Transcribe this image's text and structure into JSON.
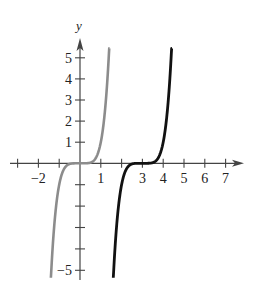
{
  "chart_data": {
    "type": "line",
    "title": "",
    "xlabel": "x",
    "ylabel": "y",
    "xlim": [
      -3,
      7.8
    ],
    "ylim": [
      -5.2,
      5.8
    ],
    "grid": false,
    "legend": null,
    "x_ticks": [
      -3,
      -2,
      -1,
      0,
      1,
      2,
      3,
      4,
      5,
      6,
      7
    ],
    "x_tick_labels": [
      {
        "value": -2,
        "label": "−2"
      },
      {
        "value": 1,
        "label": "1"
      },
      {
        "value": 3,
        "label": "3"
      },
      {
        "value": 4,
        "label": "4"
      },
      {
        "value": 5,
        "label": "5"
      },
      {
        "value": 6,
        "label": "6"
      },
      {
        "value": 7,
        "label": "7"
      }
    ],
    "y_ticks": [
      -5,
      -4,
      -3,
      -2,
      -1,
      1,
      2,
      3,
      4,
      5
    ],
    "y_tick_labels": [
      {
        "value": 5,
        "label": "5"
      },
      {
        "value": 4,
        "label": "4"
      },
      {
        "value": 3,
        "label": "3"
      },
      {
        "value": 2,
        "label": "2"
      },
      {
        "value": 1,
        "label": "1"
      },
      {
        "value": -5,
        "label": "−5"
      }
    ],
    "series": [
      {
        "name": "y = x^5",
        "color": "#8c8c8c",
        "x_range": [
          -1.4,
          1.42
        ],
        "exponent": 5,
        "shift": 0,
        "points": [
          [
            -1.4,
            -5.38
          ],
          [
            -1.2,
            -2.49
          ],
          [
            -1.0,
            -1.0
          ],
          [
            -0.5,
            -0.03
          ],
          [
            0,
            0
          ],
          [
            0.5,
            0.03
          ],
          [
            1.0,
            1.0
          ],
          [
            1.2,
            2.49
          ],
          [
            1.4,
            5.38
          ]
        ]
      },
      {
        "name": "y = (x - 3)^5",
        "color": "#111111",
        "x_range": [
          1.6,
          4.42
        ],
        "exponent": 5,
        "shift": 3,
        "points": [
          [
            1.6,
            -5.38
          ],
          [
            1.8,
            -2.49
          ],
          [
            2.0,
            -1.0
          ],
          [
            2.5,
            -0.03
          ],
          [
            3,
            0
          ],
          [
            3.5,
            0.03
          ],
          [
            4.0,
            1.0
          ],
          [
            4.2,
            2.49
          ],
          [
            4.4,
            5.38
          ]
        ]
      }
    ]
  }
}
